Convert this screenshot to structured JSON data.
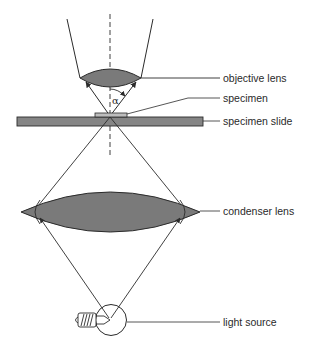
{
  "diagram": {
    "type": "optical-microscope-schematic",
    "colors": {
      "line": "#2b2b2b",
      "lens_fill": "#7a7a7a",
      "slide_fill": "#858585",
      "background": "#ffffff"
    },
    "labels": {
      "objective_lens": "objective lens",
      "specimen": "specimen",
      "specimen_slide": "specimen slide",
      "condenser_lens": "condenser lens",
      "light_source": "light source"
    },
    "angle_symbol": "α"
  }
}
